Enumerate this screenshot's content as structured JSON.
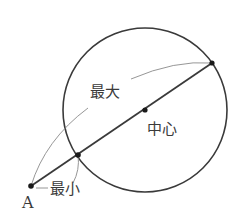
{
  "diagram": {
    "labels": {
      "point_a": "A",
      "max": "最大",
      "min": "最小",
      "center": "中心"
    },
    "colors": {
      "stroke": "#3a3a3a",
      "thin_stroke": "#8a8a8a",
      "background": "#ffffff"
    },
    "geometry": {
      "circle": {
        "cx": 145,
        "cy": 110,
        "r": 82
      },
      "point_a": {
        "x": 31,
        "y": 186
      },
      "near_point": {
        "x": 78,
        "y": 155
      },
      "far_point": {
        "x": 212,
        "y": 63
      },
      "center_point": {
        "x": 145,
        "y": 110
      }
    }
  }
}
